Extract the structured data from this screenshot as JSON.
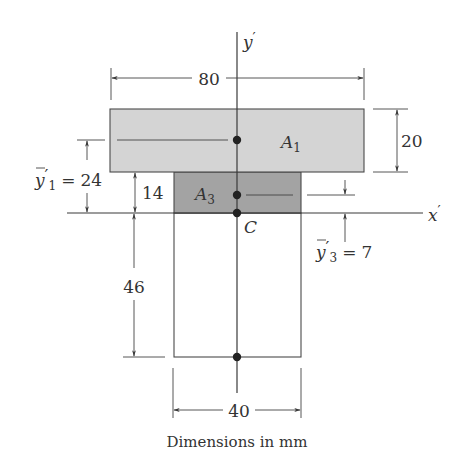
{
  "figure": {
    "caption": "Dimensions in mm",
    "colors": {
      "area_1_fill": "#d4d4d4",
      "area_3_fill": "#a3a3a3",
      "area_2_fill": "#ffffff",
      "stroke": "#3a3a3a",
      "text": "#333333"
    },
    "axes": {
      "vertical_label": "y",
      "vertical_prime": "′",
      "horizontal_label": "x",
      "horizontal_prime": "′"
    },
    "centroid_label": "C",
    "areas": {
      "a1": {
        "letter": "A",
        "subscript": "1"
      },
      "a3": {
        "letter": "A",
        "subscript": "3"
      }
    },
    "dimensions": {
      "top_width": "80",
      "flange_height": "20",
      "stem_width": "40",
      "upper_web_height": "14",
      "lower_web_height": "46",
      "y1_bar": {
        "symbol": "y",
        "prime": "′",
        "subscript": "1",
        "equals": "=",
        "value": "24"
      },
      "y3_bar": {
        "symbol": "y",
        "prime": "′",
        "subscript": "3",
        "equals": "=",
        "value": "7"
      }
    }
  }
}
